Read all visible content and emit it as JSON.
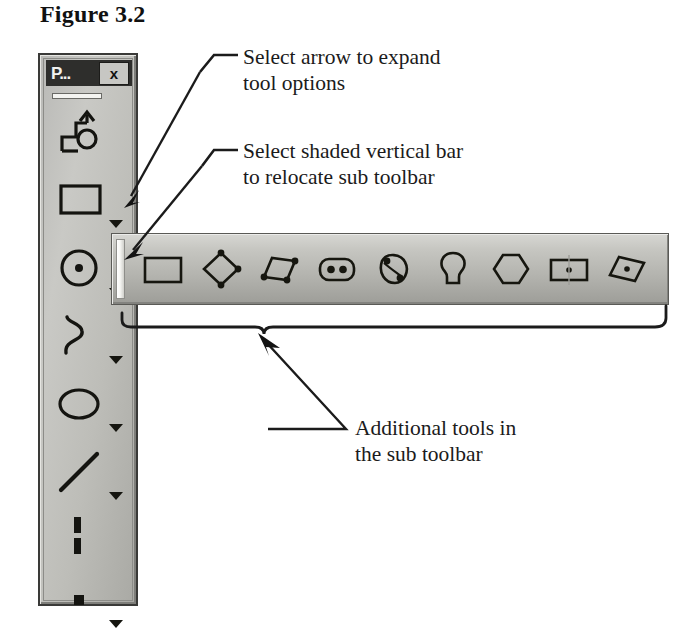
{
  "figure": {
    "title": "Figure 3.2"
  },
  "toolbar": {
    "window_title": "P...",
    "close_label": "x",
    "tools": [
      {
        "name": "profile-tool",
        "icon": "profile-arrow-icon",
        "has_expander": false
      },
      {
        "name": "rectangle-tool",
        "icon": "rectangle-icon",
        "has_expander": true
      },
      {
        "name": "circle-tool",
        "icon": "circle-center-dot-icon",
        "has_expander": true
      },
      {
        "name": "spline-tool",
        "icon": "spline-curve-icon",
        "has_expander": true
      },
      {
        "name": "ellipse-tool",
        "icon": "ellipse-icon",
        "has_expander": true
      },
      {
        "name": "line-tool",
        "icon": "line-icon",
        "has_expander": true
      },
      {
        "name": "dimension-tool",
        "icon": "dashed-line-icon",
        "has_expander": false
      },
      {
        "name": "point-tool",
        "icon": "point-square-icon",
        "has_expander": true
      }
    ]
  },
  "sub_toolbar": {
    "grip_name": "sub-toolbar-grip",
    "items": [
      {
        "name": "rectangle-shape-tool",
        "icon": "rectangle-icon"
      },
      {
        "name": "rotated-rectangle-tool",
        "icon": "diamond-nodes-icon"
      },
      {
        "name": "parallelogram-tool",
        "icon": "parallelogram-nodes-icon"
      },
      {
        "name": "rounded-slot-two-points-tool",
        "icon": "obround-two-dots-icon"
      },
      {
        "name": "curved-slot-tool",
        "icon": "curved-slot-dots-icon"
      },
      {
        "name": "keyhole-slot-tool",
        "icon": "keyhole-icon"
      },
      {
        "name": "polygon-tool",
        "icon": "hexagon-icon"
      },
      {
        "name": "center-rectangle-tool",
        "icon": "rect-center-dot-icon"
      },
      {
        "name": "center-parallelogram-tool",
        "icon": "slanted-rect-center-dot-icon"
      }
    ]
  },
  "callouts": [
    {
      "name": "callout-expand-tool-options",
      "line1": "Select arrow to expand",
      "line2": "tool options"
    },
    {
      "name": "callout-relocate-sub-toolbar",
      "line1": "Select shaded vertical bar",
      "line2": "to relocate sub toolbar"
    },
    {
      "name": "callout-additional-tools",
      "line1": "Additional tools in",
      "line2": "the sub toolbar"
    }
  ],
  "colors": {
    "toolbar_face": "#c2c2bd",
    "titlebar": "#2e2e2c",
    "ink": "#1b1b1b",
    "page": "#ffffff"
  }
}
